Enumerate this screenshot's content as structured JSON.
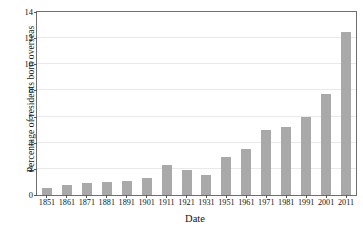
{
  "chart_data": {
    "type": "bar",
    "title": "",
    "xlabel": "Date",
    "ylabel": "Percentage of residents born overseas",
    "categories": [
      "1851",
      "1861",
      "1871",
      "1881",
      "1891",
      "1901",
      "1911",
      "1921",
      "1931",
      "1951",
      "1961",
      "1971",
      "1981",
      "1991",
      "2001",
      "2011"
    ],
    "values": [
      0.5,
      0.75,
      0.9,
      1.0,
      1.1,
      1.3,
      2.3,
      1.9,
      1.5,
      2.9,
      3.5,
      5.0,
      5.2,
      6.0,
      7.7,
      12.5
    ],
    "ylim": [
      0,
      14
    ],
    "yticks": [
      0,
      2,
      4,
      6,
      8,
      10,
      12,
      14
    ],
    "ytick_labels": [
      "0",
      "2",
      "4",
      "6",
      "8",
      "10",
      "12",
      "14"
    ],
    "grid": true,
    "legend": "none",
    "bar_color": "#a9a9a9",
    "axis_color": "#6e6e6e",
    "gridline_color": "#e9e9e9"
  }
}
